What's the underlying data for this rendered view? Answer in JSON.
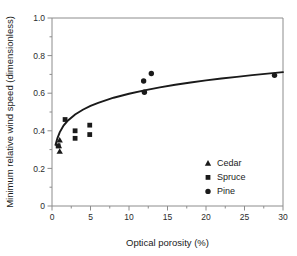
{
  "chart_data": {
    "type": "scatter",
    "title": "",
    "xlabel": "Optical porosity (%)",
    "ylabel": "Minimum relative wind speed (dimensionless)",
    "xlim": [
      0,
      30
    ],
    "ylim": [
      0,
      1.0
    ],
    "xticks": [
      0,
      5,
      10,
      15,
      20,
      25,
      30
    ],
    "xtick_labels": [
      "0",
      "5",
      "10",
      "15",
      "20",
      "25",
      "30"
    ],
    "yticks": [
      0,
      0.2,
      0.4,
      0.6,
      0.8,
      1.0
    ],
    "ytick_labels": [
      "0",
      "0.2",
      "0.4",
      "0.6",
      "0.8",
      "1.0"
    ],
    "x_minor_ticks": [
      2.5,
      7.5,
      12.5,
      17.5,
      22.5,
      27.5
    ],
    "y_minor_ticks": [
      0.1,
      0.3,
      0.5,
      0.7,
      0.9
    ],
    "grid": false,
    "legend_position": "lower right",
    "series": [
      {
        "name": "Cedar",
        "marker": "triangle",
        "color": "#1a1a1a",
        "points": [
          {
            "x": 1.0,
            "y": 0.35
          },
          {
            "x": 0.9,
            "y": 0.32
          },
          {
            "x": 1.0,
            "y": 0.29
          }
        ]
      },
      {
        "name": "Spruce",
        "marker": "square",
        "color": "#1a1a1a",
        "points": [
          {
            "x": 0.8,
            "y": 0.32
          },
          {
            "x": 1.7,
            "y": 0.46
          },
          {
            "x": 3.0,
            "y": 0.4
          },
          {
            "x": 3.0,
            "y": 0.36
          },
          {
            "x": 4.9,
            "y": 0.43
          },
          {
            "x": 4.9,
            "y": 0.38
          }
        ]
      },
      {
        "name": "Pine",
        "marker": "circle",
        "color": "#1a1a1a",
        "points": [
          {
            "x": 12.0,
            "y": 0.605
          },
          {
            "x": 11.9,
            "y": 0.665
          },
          {
            "x": 12.9,
            "y": 0.705
          },
          {
            "x": 28.9,
            "y": 0.695
          }
        ]
      }
    ],
    "fit_curve": {
      "name": "logarithmic fit",
      "color": "#1a1a1a",
      "points": [
        {
          "x": 0.45,
          "y": 0.325
        },
        {
          "x": 0.7,
          "y": 0.36
        },
        {
          "x": 1.0,
          "y": 0.392
        },
        {
          "x": 1.5,
          "y": 0.428
        },
        {
          "x": 2.0,
          "y": 0.452
        },
        {
          "x": 3.0,
          "y": 0.487
        },
        {
          "x": 4.0,
          "y": 0.512
        },
        {
          "x": 5.0,
          "y": 0.532
        },
        {
          "x": 6.0,
          "y": 0.549
        },
        {
          "x": 8.0,
          "y": 0.576
        },
        {
          "x": 10.0,
          "y": 0.597
        },
        {
          "x": 12.0,
          "y": 0.615
        },
        {
          "x": 14.0,
          "y": 0.631
        },
        {
          "x": 16.0,
          "y": 0.645
        },
        {
          "x": 18.0,
          "y": 0.657
        },
        {
          "x": 20.0,
          "y": 0.668
        },
        {
          "x": 22.0,
          "y": 0.678
        },
        {
          "x": 24.0,
          "y": 0.687
        },
        {
          "x": 26.0,
          "y": 0.696
        },
        {
          "x": 28.0,
          "y": 0.704
        },
        {
          "x": 30.0,
          "y": 0.712
        }
      ]
    },
    "legend": [
      {
        "label": "Cedar",
        "marker": "triangle"
      },
      {
        "label": "Spruce",
        "marker": "square"
      },
      {
        "label": "Pine",
        "marker": "circle"
      }
    ]
  }
}
